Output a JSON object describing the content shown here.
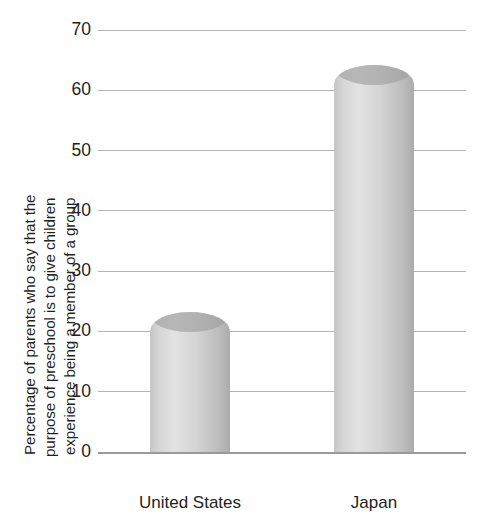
{
  "chart_data": {
    "type": "bar",
    "title": "",
    "subtitle": "",
    "xlabel": "",
    "ylabel_lines": [
      "Percentage of parents who say that the",
      "purpose of preschool is to give children",
      "experience being a member of a group"
    ],
    "ylabel": "Percentage of parents who say that the purpose of preschool is to give children experience being a member of a group",
    "categories": [
      "United States",
      "Japan"
    ],
    "values": [
      20,
      61
    ],
    "ylim": [
      0,
      70
    ],
    "ytick_values": [
      0,
      10,
      20,
      30,
      40,
      50,
      60,
      70
    ],
    "ytick_labels": [
      "0",
      "10",
      "20",
      "30",
      "40",
      "50",
      "60",
      "70"
    ],
    "grid": true,
    "legend": false,
    "legend_position": "none",
    "bar_style": "cylinder",
    "colors": {
      "bar_light": "#e2e2e2",
      "bar_mid": "#d4d4d4",
      "bar_dark": "#ababab",
      "bar_cap_shade": "#9d9d9d",
      "gridline": "#b4b4b4",
      "axis": "#9a9a9a",
      "text": "#231f20",
      "background": "#ffffff"
    }
  }
}
